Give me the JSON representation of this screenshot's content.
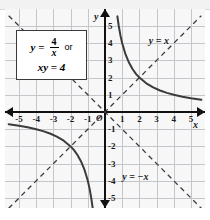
{
  "figure": {
    "title_equation_box": {
      "line1_lhs": "y",
      "line1_eq": "=",
      "fraction_numerator": "4",
      "fraction_denominator": "x",
      "line1_or": "or",
      "line2": "xy = 4"
    },
    "axis_names": {
      "x": "x",
      "y": "y"
    },
    "asymptote_labels": [
      {
        "id": "y-equals-x",
        "text": "y = x"
      },
      {
        "id": "y-equals-negative-x",
        "text": "y = −x"
      }
    ],
    "origin_label": "O",
    "x_ticks": [
      "-5",
      "-4",
      "-3",
      "-2",
      "-1",
      "1",
      "2",
      "3",
      "4",
      "5"
    ],
    "y_ticks": [
      "5",
      "4",
      "3",
      "2",
      "1",
      "-1",
      "-2",
      "-3",
      "-4",
      "-5"
    ],
    "colors": {
      "curve": "#3b3b3b",
      "axis": "#111111",
      "grid": "#c3c7cc",
      "plot_background": "#f7f7f7",
      "box_background": "#ffffff",
      "box_border": "#3a3a3a",
      "top_band": "#f2f2f2"
    }
  },
  "chart_data": {
    "type": "line",
    "xlabel": "x",
    "ylabel": "y",
    "xlim": [
      -5.8,
      5.8
    ],
    "ylim": [
      -5.8,
      5.8
    ],
    "grid": true,
    "legend": "none",
    "annotations": [
      {
        "text": "y = x",
        "x": 3.4,
        "y": 3.9
      },
      {
        "text": "y = −x",
        "x": 2.1,
        "y": -3.9
      },
      {
        "text": "O",
        "x": -0.35,
        "y": -0.4
      }
    ],
    "series": [
      {
        "name": "y = 4/x (branch x>0)",
        "style": "solid",
        "x": [
          0.72,
          0.8,
          0.9,
          1.0,
          1.2,
          1.4,
          1.6,
          1.8,
          2.0,
          2.4,
          2.8,
          3.2,
          3.6,
          4.0,
          4.5,
          5.0,
          5.6
        ],
        "y": [
          5.56,
          5.0,
          4.44,
          4.0,
          3.33,
          2.86,
          2.5,
          2.22,
          2.0,
          1.67,
          1.43,
          1.25,
          1.11,
          1.0,
          0.89,
          0.8,
          0.71
        ]
      },
      {
        "name": "y = 4/x (branch x<0)",
        "style": "solid",
        "x": [
          -5.6,
          -5.0,
          -4.5,
          -4.0,
          -3.6,
          -3.2,
          -2.8,
          -2.4,
          -2.0,
          -1.8,
          -1.6,
          -1.4,
          -1.2,
          -1.0,
          -0.9,
          -0.8,
          -0.72
        ],
        "y": [
          -0.71,
          -0.8,
          -0.89,
          -1.0,
          -1.11,
          -1.25,
          -1.43,
          -1.67,
          -2.0,
          -2.22,
          -2.5,
          -2.86,
          -3.33,
          -4.0,
          -4.44,
          -5.0,
          -5.56
        ]
      },
      {
        "name": "y = x",
        "style": "dashed",
        "x": [
          -5.6,
          5.6
        ],
        "y": [
          -5.6,
          5.6
        ]
      },
      {
        "name": "y = -x",
        "style": "dashed",
        "x": [
          -5.6,
          5.6
        ],
        "y": [
          5.6,
          -5.6
        ]
      }
    ],
    "intersections": [
      {
        "label": "(2, 2)",
        "x": 2,
        "y": 2
      },
      {
        "label": "(-2, -2)",
        "x": -2,
        "y": -2
      }
    ]
  }
}
